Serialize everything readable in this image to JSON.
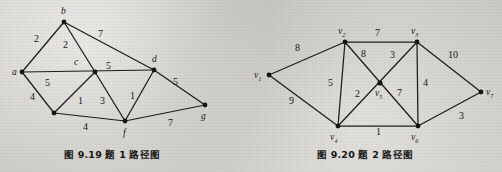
{
  "page": {
    "background_color": "#d0cec9",
    "ink_color": "#141414"
  },
  "figures": [
    {
      "id": "figure-9-19",
      "caption": "图 9.19   题 1 路径图",
      "caption_number": "9.19",
      "caption_text": "题 1 路径图",
      "type": "weighted-undirected-graph",
      "nodes": [
        {
          "id": "a",
          "label": "a",
          "x": 22,
          "y": 72,
          "label_x": 12,
          "label_y": 75
        },
        {
          "id": "b",
          "label": "b",
          "x": 64,
          "y": 22,
          "label_x": 61,
          "label_y": 14
        },
        {
          "id": "c",
          "label": "c",
          "x": 95,
          "y": 72,
          "label_x": 74,
          "label_y": 65
        },
        {
          "id": "d",
          "label": "d",
          "x": 154,
          "y": 70,
          "label_x": 152,
          "label_y": 62
        },
        {
          "id": "e",
          "label": "",
          "x": 54,
          "y": 113,
          "label_x": 0,
          "label_y": 0
        },
        {
          "id": "f",
          "label": "f",
          "x": 125,
          "y": 121,
          "label_x": 123,
          "label_y": 136
        },
        {
          "id": "g",
          "label": "g",
          "x": 205,
          "y": 105,
          "label_x": 201,
          "label_y": 119
        }
      ],
      "edges": [
        {
          "from": "a",
          "to": "b",
          "weight": "2",
          "label_x": 38,
          "label_y": 42
        },
        {
          "from": "b",
          "to": "c",
          "weight": "2",
          "label_x": 66,
          "label_y": 48
        },
        {
          "from": "b",
          "to": "d",
          "weight": "7",
          "label_x": 101,
          "label_y": 37
        },
        {
          "from": "a",
          "to": "d",
          "weight": "5",
          "label_x": 109,
          "label_y": 69
        },
        {
          "from": "a",
          "to": "e",
          "weight": "4",
          "label_x": 33,
          "label_y": 100
        },
        {
          "from": "c",
          "to": "e",
          "weight": "5",
          "label_x": 48,
          "label_y": 86
        },
        {
          "from": "c",
          "to": "f",
          "weight": "3",
          "label_x": 103,
          "label_y": 104
        },
        {
          "from": "e",
          "to": "f",
          "weight": "4",
          "label_x": 86,
          "label_y": 130
        },
        {
          "from": "c",
          "to": "e2",
          "weight": "1",
          "label_x": 81,
          "label_y": 104
        },
        {
          "from": "d",
          "to": "f",
          "weight": "1",
          "label_x": 133,
          "label_y": 99
        },
        {
          "from": "d",
          "to": "g",
          "weight": "5",
          "label_x": 176,
          "label_y": 85
        },
        {
          "from": "f",
          "to": "g",
          "weight": "7",
          "label_x": 171,
          "label_y": 126
        }
      ]
    },
    {
      "id": "figure-9-20",
      "caption": "图 9.20   题 2 路径图",
      "caption_number": "9.20",
      "caption_text": "题 2 路径图",
      "type": "weighted-undirected-graph",
      "nodes": [
        {
          "id": "v1",
          "label": "v",
          "sub": "1",
          "x": 269,
          "y": 75,
          "label_x": 254,
          "label_y": 78
        },
        {
          "id": "v2",
          "label": "v",
          "sub": "2",
          "x": 345,
          "y": 42,
          "label_x": 338,
          "label_y": 34
        },
        {
          "id": "v3",
          "label": "v",
          "sub": "3",
          "x": 417,
          "y": 42,
          "label_x": 411,
          "label_y": 34
        },
        {
          "id": "v4",
          "label": "v",
          "sub": "4",
          "x": 338,
          "y": 126,
          "label_x": 330,
          "label_y": 140
        },
        {
          "id": "v5",
          "label": "v",
          "sub": "5",
          "x": 380,
          "y": 83,
          "label_x": 375,
          "label_y": 96
        },
        {
          "id": "v6",
          "label": "v",
          "sub": "6",
          "x": 418,
          "y": 126,
          "label_x": 411,
          "label_y": 140
        },
        {
          "id": "v7",
          "label": "v",
          "sub": "7",
          "x": 481,
          "y": 92,
          "label_x": 486,
          "label_y": 95
        }
      ],
      "edges": [
        {
          "from": "v1",
          "to": "v2",
          "weight": "8",
          "label_x": 298,
          "label_y": 51
        },
        {
          "from": "v1",
          "to": "v4",
          "weight": "9",
          "label_x": 292,
          "label_y": 104
        },
        {
          "from": "v2",
          "to": "v3",
          "weight": "7",
          "label_x": 378,
          "label_y": 36
        },
        {
          "from": "v2",
          "to": "v4",
          "weight": "5",
          "label_x": 331,
          "label_y": 86
        },
        {
          "from": "v2",
          "to": "v6",
          "weight": "8",
          "label_x": 364,
          "label_y": 57
        },
        {
          "from": "v3",
          "to": "v4",
          "weight": "3",
          "label_x": 393,
          "label_y": 58
        },
        {
          "from": "v3",
          "to": "v6",
          "weight": "4",
          "label_x": 426,
          "label_y": 86
        },
        {
          "from": "v3",
          "to": "v7",
          "weight": "10",
          "label_x": 453,
          "label_y": 58
        },
        {
          "from": "v4",
          "to": "v5",
          "weight": "2",
          "label_x": 358,
          "label_y": 97
        },
        {
          "from": "v4",
          "to": "v6",
          "weight": "1",
          "label_x": 378,
          "label_y": 135
        },
        {
          "from": "v5",
          "to": "v6",
          "weight": "7",
          "label_x": 400,
          "label_y": 96
        },
        {
          "from": "v6",
          "to": "v7",
          "weight": "3",
          "label_x": 462,
          "label_y": 119
        }
      ]
    }
  ]
}
